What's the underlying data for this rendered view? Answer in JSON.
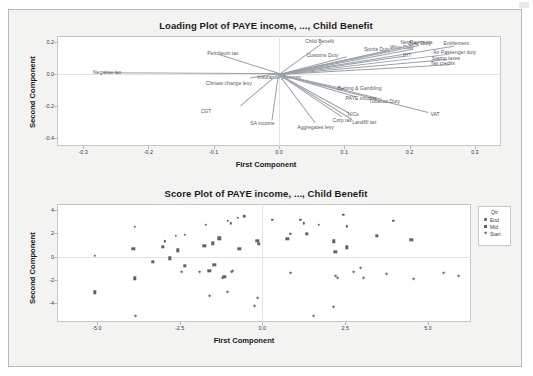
{
  "figure": {
    "background_color": "#f3f3f1",
    "plot_background": "#ffffff",
    "marker_color": "#5e6369",
    "vector_color": "#9aa0a8"
  },
  "chart_data": [
    {
      "type": "scatter",
      "name": "loading-plot",
      "title": "Loading Plot of PAYE income, ..., Child Benefit",
      "xlabel": "First Component",
      "ylabel": "Second Component",
      "xlim": [
        -0.34,
        0.34
      ],
      "ylim": [
        -0.45,
        0.24
      ],
      "xticks": [
        "-0.3",
        "-0.2",
        "-0.1",
        "0.0",
        "0.1",
        "0.2",
        "0.3"
      ],
      "xtickvals": [
        -0.3,
        -0.2,
        -0.1,
        0.0,
        0.1,
        0.2,
        0.3
      ],
      "yticks": [
        "0.2",
        "0.0",
        "-0.2",
        "-0.4"
      ],
      "ytickvals": [
        0.2,
        0.0,
        -0.2,
        -0.4
      ],
      "grid": false,
      "legend": "none",
      "loadings": [
        {
          "label": "Negative tax",
          "x": -0.268,
          "y": 0.004,
          "lx": -0.285,
          "ly": 0.013
        },
        {
          "label": "Petroleum tax",
          "x": -0.092,
          "y": 0.119,
          "lx": -0.11,
          "ly": 0.135
        },
        {
          "label": "Climate change levy",
          "x": -0.044,
          "y": -0.028,
          "lx": -0.112,
          "ly": -0.052
        },
        {
          "label": "Insurance premium",
          "x": -0.012,
          "y": -0.004,
          "lx": -0.033,
          "ly": -0.018
        },
        {
          "label": "CGT",
          "x": -0.058,
          "y": -0.2,
          "lx": -0.12,
          "ly": -0.232
        },
        {
          "label": "SA income",
          "x": -0.01,
          "y": -0.29,
          "lx": -0.044,
          "ly": -0.305
        },
        {
          "label": "Aggregates levy",
          "x": 0.056,
          "y": -0.305,
          "lx": 0.028,
          "ly": -0.33
        },
        {
          "label": "Corp tax",
          "x": 0.097,
          "y": -0.268,
          "lx": 0.082,
          "ly": -0.288
        },
        {
          "label": "Landfill tax",
          "x": 0.112,
          "y": -0.282,
          "lx": 0.112,
          "ly": -0.3
        },
        {
          "label": "NICs",
          "x": 0.108,
          "y": -0.243,
          "lx": 0.105,
          "ly": -0.252
        },
        {
          "label": "VAT",
          "x": 0.228,
          "y": -0.238,
          "lx": 0.232,
          "ly": -0.25
        },
        {
          "label": "Tobacco Duty",
          "x": 0.158,
          "y": -0.155,
          "lx": 0.138,
          "ly": -0.168
        },
        {
          "label": "PAYE income",
          "x": 0.118,
          "y": -0.14,
          "lx": 0.102,
          "ly": -0.146
        },
        {
          "label": "Betting & Gambling",
          "x": 0.1,
          "y": -0.09,
          "lx": 0.09,
          "ly": -0.086
        },
        {
          "label": "Child Benefit",
          "x": 0.064,
          "y": 0.19,
          "lx": 0.04,
          "ly": 0.206
        },
        {
          "label": "Customs Duty",
          "x": 0.104,
          "y": 0.111,
          "lx": 0.042,
          "ly": 0.118
        },
        {
          "label": "Spirits Duty",
          "x": 0.168,
          "y": 0.15,
          "lx": 0.13,
          "ly": 0.16
        },
        {
          "label": "Wine Duty",
          "x": 0.204,
          "y": 0.158,
          "lx": 0.17,
          "ly": 0.172
        },
        {
          "label": "Net Payments",
          "x": 0.206,
          "y": 0.186,
          "lx": 0.186,
          "ly": 0.2
        },
        {
          "label": "Beer Duty",
          "x": 0.214,
          "y": 0.182,
          "lx": 0.198,
          "ly": 0.198
        },
        {
          "label": "Entitlement",
          "x": 0.268,
          "y": 0.178,
          "lx": 0.252,
          "ly": 0.196
        },
        {
          "label": "Air Passenger duty",
          "x": 0.262,
          "y": 0.128,
          "lx": 0.236,
          "ly": 0.138
        },
        {
          "label": "Stamp taxes",
          "x": 0.258,
          "y": 0.094,
          "lx": 0.234,
          "ly": 0.104
        },
        {
          "label": "Tax credits",
          "x": 0.262,
          "y": 0.062,
          "lx": 0.232,
          "ly": 0.07
        },
        {
          "label": "IHT",
          "x": 0.194,
          "y": 0.116,
          "lx": 0.19,
          "ly": 0.122
        }
      ]
    },
    {
      "type": "scatter",
      "name": "score-plot",
      "title": "Score Plot of PAYE income, ..., Child Benefit",
      "xlabel": "First Component",
      "ylabel": "Second Component",
      "xlim": [
        -6.2,
        6.3
      ],
      "ylim": [
        -5.6,
        4.5
      ],
      "xticks": [
        "-5.0",
        "-2.5",
        "0.0",
        "2.5",
        "5.0"
      ],
      "xtickvals": [
        -5.0,
        -2.5,
        0.0,
        2.5,
        5.0
      ],
      "yticks": [
        "4",
        "2",
        "0",
        "-2",
        "-4"
      ],
      "ytickvals": [
        4,
        2,
        0,
        -2,
        -4
      ],
      "grid": false,
      "legend_title": "Qtr",
      "legend_position": "right",
      "series": [
        {
          "name": "End",
          "marker": "circle",
          "points": [
            [
              -5.05,
              0.08
            ],
            [
              -3.85,
              2.55
            ],
            [
              -2.35,
              1.85
            ],
            [
              -2.62,
              1.8
            ],
            [
              -1.7,
              2.7
            ],
            [
              -1.05,
              3.05
            ],
            [
              -0.75,
              3.3
            ],
            [
              -0.55,
              3.45
            ],
            [
              -0.95,
              2.85
            ],
            [
              0.3,
              3.15
            ],
            [
              1.15,
              3.15
            ],
            [
              1.25,
              2.85
            ],
            [
              1.7,
              2.7
            ],
            [
              2.45,
              3.55
            ],
            [
              2.55,
              2.6
            ],
            [
              3.95,
              3.05
            ],
            [
              0.85,
              1.95
            ],
            [
              -2.95,
              1.3
            ]
          ]
        },
        {
          "name": "Mid",
          "marker": "square",
          "points": [
            [
              -5.05,
              -3.05
            ],
            [
              -3.9,
              0.65
            ],
            [
              -3.85,
              -1.85
            ],
            [
              -3.0,
              0.85
            ],
            [
              -2.8,
              -0.15
            ],
            [
              -3.3,
              -0.45
            ],
            [
              -2.55,
              0.55
            ],
            [
              -2.35,
              -0.8
            ],
            [
              -1.75,
              0.9
            ],
            [
              -1.5,
              1.15
            ],
            [
              -1.3,
              1.55
            ],
            [
              -1.6,
              -1.2
            ],
            [
              -1.45,
              -0.7
            ],
            [
              -1.15,
              -1.75
            ],
            [
              -0.7,
              0.65
            ],
            [
              -0.15,
              1.35
            ],
            [
              -0.1,
              1.1
            ],
            [
              0.75,
              1.5
            ],
            [
              1.35,
              1.95
            ],
            [
              2.15,
              1.3
            ],
            [
              2.2,
              0.4
            ],
            [
              2.55,
              0.8
            ],
            [
              3.45,
              1.8
            ],
            [
              4.5,
              1.45
            ]
          ]
        },
        {
          "name": "Start",
          "marker": "diamond",
          "points": [
            [
              -3.85,
              -5.05
            ],
            [
              -2.45,
              -1.35
            ],
            [
              -1.9,
              -1.35
            ],
            [
              -1.6,
              -3.4
            ],
            [
              -1.2,
              -1.8
            ],
            [
              -0.95,
              -1.3
            ],
            [
              -0.9,
              -1.2
            ],
            [
              -1.05,
              -3.0
            ],
            [
              -0.15,
              -3.55
            ],
            [
              -0.25,
              -4.2
            ],
            [
              0.85,
              -1.4
            ],
            [
              1.55,
              -5.05
            ],
            [
              2.15,
              -4.35
            ],
            [
              2.2,
              -1.65
            ],
            [
              2.25,
              -1.85
            ],
            [
              2.75,
              -1.35
            ],
            [
              2.95,
              -0.95
            ],
            [
              3.05,
              -1.85
            ],
            [
              3.75,
              -1.45
            ],
            [
              4.55,
              -1.9
            ],
            [
              5.45,
              -1.4
            ],
            [
              5.9,
              -1.7
            ]
          ]
        }
      ]
    }
  ]
}
